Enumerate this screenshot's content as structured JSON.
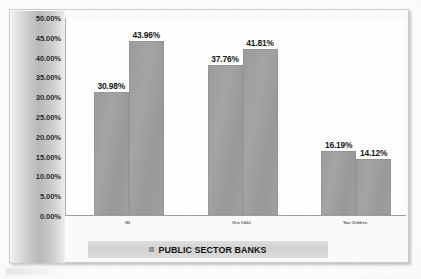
{
  "chart_data": {
    "type": "bar",
    "title": "",
    "subtitle": "",
    "xlabel": "",
    "ylabel": "",
    "categories": [
      "Nil",
      "One Child",
      "Two Children"
    ],
    "series": [
      {
        "name": "Series 1",
        "values": [
          30.98,
          43.96,
          37.76
        ]
      },
      {
        "name": "Series 2",
        "values": [
          43.96,
          41.81,
          14.12
        ]
      }
    ],
    "bars": [
      {
        "category": "Nil",
        "label": "30.98%",
        "value": 30.98
      },
      {
        "category": "Nil",
        "label": "43.96%",
        "value": 43.96
      },
      {
        "category": "One Child",
        "label": "37.76%",
        "value": 37.76
      },
      {
        "category": "One Child",
        "label": "41.81%",
        "value": 41.81
      },
      {
        "category": "Two Children",
        "label": "16.19%",
        "value": 16.19
      },
      {
        "category": "Two Children",
        "label": "14.12%",
        "value": 14.12
      }
    ],
    "ylim": [
      0,
      50
    ],
    "ytick_step": 5,
    "yticks": [
      "50.00%",
      "45.00%",
      "40.00%",
      "35.00%",
      "30.00%",
      "25.00%",
      "20.00%",
      "15.00%",
      "10.00%",
      "5.00%",
      "0.00%"
    ],
    "grid": false,
    "legend_position": "bottom",
    "legend": [
      "PUBLIC SECTOR BANKS"
    ],
    "colors": {
      "bar": "#9f9f9f",
      "axis_strip": "#b9b9b9",
      "legend_band": "#d6d6d6",
      "plot_background": "#ffffff",
      "frame_border": "#cfcfcf",
      "label_text": "#181818"
    }
  },
  "legend": {
    "label": "PUBLIC SECTOR BANKS",
    "swatch": "legend-swatch-icon"
  }
}
